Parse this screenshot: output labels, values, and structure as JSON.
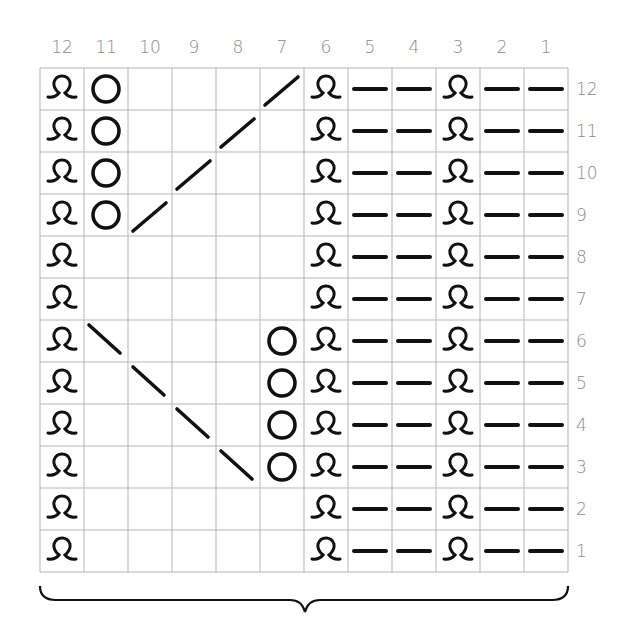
{
  "chart_data": {
    "type": "table",
    "columns": [
      12,
      11,
      10,
      9,
      8,
      7,
      6,
      5,
      4,
      3,
      2,
      1
    ],
    "rows": [
      12,
      11,
      10,
      9,
      8,
      7,
      6,
      5,
      4,
      3,
      2,
      1
    ],
    "legend": {
      "Q": "twisted-knit-stitch (loop symbol)",
      "O": "yarn-over",
      "-": "purl",
      "/": "right-leaning-decrease",
      "\\": "left-leaning-decrease",
      "": "knit (blank)"
    },
    "grid": [
      [
        "Q",
        "O",
        "",
        "",
        "",
        "/",
        "Q",
        "-",
        "-",
        "Q",
        "-",
        "-"
      ],
      [
        "Q",
        "O",
        "",
        "",
        "/",
        "",
        "Q",
        "-",
        "-",
        "Q",
        "-",
        "-"
      ],
      [
        "Q",
        "O",
        "",
        "/",
        "",
        "",
        "Q",
        "-",
        "-",
        "Q",
        "-",
        "-"
      ],
      [
        "Q",
        "O",
        "/",
        "",
        "",
        "",
        "Q",
        "-",
        "-",
        "Q",
        "-",
        "-"
      ],
      [
        "Q",
        "",
        "",
        "",
        "",
        "",
        "Q",
        "-",
        "-",
        "Q",
        "-",
        "-"
      ],
      [
        "Q",
        "",
        "",
        "",
        "",
        "",
        "Q",
        "-",
        "-",
        "Q",
        "-",
        "-"
      ],
      [
        "Q",
        "\\",
        "",
        "",
        "",
        "O",
        "Q",
        "-",
        "-",
        "Q",
        "-",
        "-"
      ],
      [
        "Q",
        "",
        "\\",
        "",
        "",
        "O",
        "Q",
        "-",
        "-",
        "Q",
        "-",
        "-"
      ],
      [
        "Q",
        "",
        "",
        "\\",
        "",
        "O",
        "Q",
        "-",
        "-",
        "Q",
        "-",
        "-"
      ],
      [
        "Q",
        "",
        "",
        "",
        "\\",
        "O",
        "Q",
        "-",
        "-",
        "Q",
        "-",
        "-"
      ],
      [
        "Q",
        "",
        "",
        "",
        "",
        "",
        "Q",
        "-",
        "-",
        "Q",
        "-",
        "-"
      ],
      [
        "Q",
        "",
        "",
        "",
        "",
        "",
        "Q",
        "-",
        "-",
        "Q",
        "-",
        "-"
      ]
    ],
    "layout": {
      "repeat_brace": "under all 12 columns",
      "column_numbers": "top, right-to-left",
      "row_numbers": "right side, bottom-to-top"
    }
  },
  "colors": {
    "grid_line": "#b5b5b5",
    "symbol": "#111111",
    "label": "#8a8a8a"
  }
}
